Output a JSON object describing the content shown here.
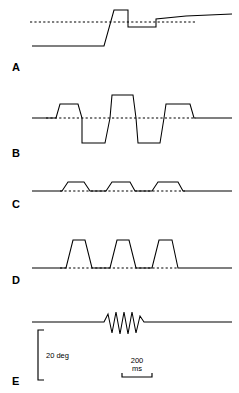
{
  "figure": {
    "kind": "multi-trace-waveform-figure",
    "width": 239,
    "height": 393,
    "background_color": "#ffffff",
    "line_color": "#000000"
  },
  "panels": [
    {
      "letter": "A",
      "letter_x": 12,
      "letter_y": 62
    },
    {
      "letter": "B",
      "letter_x": 12,
      "letter_y": 148
    },
    {
      "letter": "C",
      "letter_x": 12,
      "letter_y": 199
    },
    {
      "letter": "D",
      "letter_x": 12,
      "letter_y": 275
    },
    {
      "letter": "E",
      "letter_x": 12,
      "letter_y": 376
    }
  ],
  "scale_bars": {
    "vertical": {
      "label": "20 deg",
      "label_x": 46,
      "label_y": 352,
      "x": 38,
      "y_top": 330,
      "y_bottom": 380,
      "cap_width": 6
    },
    "horizontal": {
      "label_value": "200",
      "label_units": "ms",
      "label_x": 137,
      "label_y": 357,
      "x_left": 122,
      "x_right": 152,
      "y": 377,
      "cap_height": 4
    }
  },
  "chart_data": {
    "type": "line",
    "title": "",
    "xlabel": "",
    "ylabel": "",
    "grid": false,
    "legend": null,
    "axis_units": {
      "y": "deg",
      "x": "ms"
    },
    "scale_reference": {
      "y_amount": 20,
      "y_unit": "deg",
      "x_amount": 200,
      "x_unit": "ms"
    },
    "traces": [
      {
        "name": "A",
        "description": "Step response with overshoot: flat low baseline, rapid upward step, square overshoot plateau, dip below final level, then settle on slowly rising plateau",
        "baseline_y": 22,
        "baseline_dash": {
          "x_start": 30,
          "x_end": 196
        },
        "points": [
          [
            32,
            46
          ],
          [
            104,
            46
          ],
          [
            114,
            10
          ],
          [
            128,
            10
          ],
          [
            128,
            27
          ],
          [
            156,
            27
          ],
          [
            156,
            19
          ],
          [
            186,
            16
          ],
          [
            232,
            14
          ]
        ]
      },
      {
        "name": "B",
        "description": "Biphasic oscillating square waveform: small positive pulse, large negative pulse, tall positive pulse, large negative pulse, medium positive pulse, return to baseline",
        "baseline_y": 118,
        "baseline_dash": {
          "x_start": 46,
          "x_end": 196
        },
        "points": [
          [
            32,
            118
          ],
          [
            56,
            118
          ],
          [
            60,
            104
          ],
          [
            78,
            104
          ],
          [
            82,
            118
          ],
          [
            82,
            143
          ],
          [
            105,
            143
          ],
          [
            110,
            118
          ],
          [
            112,
            95
          ],
          [
            133,
            95
          ],
          [
            136,
            118
          ],
          [
            138,
            143
          ],
          [
            160,
            143
          ],
          [
            164,
            118
          ],
          [
            166,
            104
          ],
          [
            190,
            104
          ],
          [
            194,
            118
          ],
          [
            232,
            118
          ]
        ]
      },
      {
        "name": "C",
        "description": "Three small positive trapezoidal pulses on a flat baseline",
        "baseline_y": 191,
        "baseline_dash": {
          "x_start": 60,
          "x_end": 185
        },
        "points": [
          [
            32,
            191
          ],
          [
            62,
            191
          ],
          [
            68,
            182
          ],
          [
            84,
            182
          ],
          [
            90,
            191
          ],
          [
            106,
            191
          ],
          [
            112,
            182
          ],
          [
            130,
            182
          ],
          [
            135,
            191
          ],
          [
            152,
            191
          ],
          [
            158,
            182
          ],
          [
            178,
            182
          ],
          [
            183,
            191
          ],
          [
            232,
            191
          ]
        ]
      },
      {
        "name": "D",
        "description": "Three tall narrow trapezoidal pulses with sloped flanks on a flat baseline",
        "baseline_y": 268,
        "baseline_dash": {
          "x_start": 60,
          "x_end": 178
        },
        "points": [
          [
            32,
            268
          ],
          [
            66,
            268
          ],
          [
            73,
            240
          ],
          [
            85,
            240
          ],
          [
            92,
            268
          ],
          [
            110,
            268
          ],
          [
            117,
            240
          ],
          [
            129,
            240
          ],
          [
            136,
            268
          ],
          [
            152,
            268
          ],
          [
            159,
            240
          ],
          [
            172,
            240
          ],
          [
            178,
            268
          ],
          [
            232,
            268
          ]
        ]
      },
      {
        "name": "E",
        "description": "Flat baseline interrupted by a short high-frequency oscillation burst of about five cycles",
        "baseline_y": 322,
        "baseline_dash": null,
        "points": [
          [
            32,
            322
          ],
          [
            104,
            322
          ],
          [
            108,
            314
          ],
          [
            112,
            333
          ],
          [
            116,
            312
          ],
          [
            120,
            334
          ],
          [
            124,
            312
          ],
          [
            128,
            334
          ],
          [
            132,
            312
          ],
          [
            136,
            333
          ],
          [
            140,
            316
          ],
          [
            144,
            322
          ],
          [
            232,
            322
          ]
        ]
      }
    ]
  }
}
